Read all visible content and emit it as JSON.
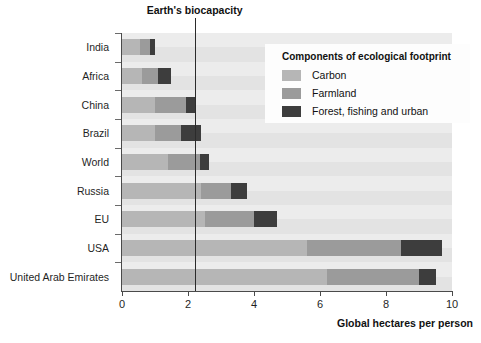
{
  "chart_data": {
    "type": "bar",
    "orientation": "horizontal",
    "stacked": true,
    "title": "",
    "xlabel": "Global hectares per person",
    "ylabel": "",
    "xlim": [
      0,
      10
    ],
    "xticks": [
      0,
      2,
      4,
      6,
      8,
      10
    ],
    "grid": false,
    "legend_position": "upper right",
    "legend_title": "Components of ecological footprint",
    "categories": [
      "India",
      "Africa",
      "China",
      "Brazil",
      "World",
      "Russia",
      "EU",
      "USA",
      "United Arab Emirates"
    ],
    "series": [
      {
        "name": "Carbon",
        "color": "#b6b6b6",
        "values": [
          0.55,
          0.6,
          1.0,
          1.0,
          1.4,
          2.4,
          2.5,
          5.6,
          6.2
        ]
      },
      {
        "name": "Farmland",
        "color": "#9b9b9b",
        "values": [
          0.3,
          0.5,
          0.95,
          0.8,
          0.95,
          0.9,
          1.5,
          2.85,
          2.8
        ]
      },
      {
        "name": "Forest, fishing and urban",
        "color": "#3d3d3d",
        "values": [
          0.15,
          0.4,
          0.3,
          0.6,
          0.3,
          0.5,
          0.7,
          1.25,
          0.5
        ]
      }
    ],
    "totals": [
      1.0,
      1.5,
      2.25,
      2.4,
      2.65,
      3.8,
      4.7,
      9.7,
      9.5
    ],
    "annotations": [
      {
        "name": "Earth's biocapacity",
        "label": "Earth's biocapacity",
        "x": 2.2,
        "type": "vline"
      }
    ]
  },
  "legend": {
    "title": "Components of ecological footprint",
    "items": [
      {
        "label": "Carbon",
        "color": "#b6b6b6"
      },
      {
        "label": "Farmland",
        "color": "#9b9b9b"
      },
      {
        "label": "Forest, fishing and urban",
        "color": "#3d3d3d"
      }
    ]
  },
  "axis": {
    "x_title": "Global hectares per person",
    "x_ticks": [
      "0",
      "2",
      "4",
      "6",
      "8",
      "10"
    ]
  },
  "annotation": {
    "biocapacity_label": "Earth's biocapacity"
  }
}
